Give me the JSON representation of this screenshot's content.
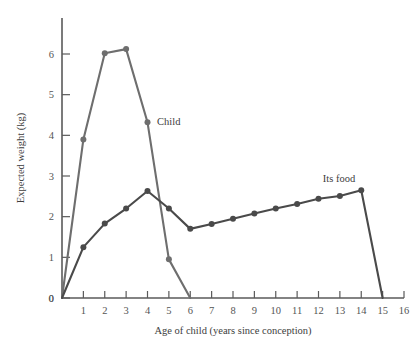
{
  "chart_data": {
    "type": "line",
    "title": "",
    "xlabel": "Age of child (years since conception)",
    "ylabel": "Expected weight (kg)",
    "xlim": [
      0,
      16
    ],
    "ylim": [
      0,
      6.6
    ],
    "xticks": [
      0,
      1,
      2,
      3,
      4,
      5,
      6,
      7,
      8,
      9,
      10,
      11,
      12,
      13,
      14,
      15,
      16
    ],
    "xtick_labels": [
      "0",
      "1",
      "2",
      "3",
      "4",
      "5",
      "6",
      "7",
      "8",
      "9",
      "10",
      "11",
      "12",
      "13",
      "14",
      "15",
      "16"
    ],
    "yticks": [
      0,
      1,
      2,
      3,
      4,
      5,
      6
    ],
    "ytick_labels": [
      "0",
      "1",
      "2",
      "3",
      "4",
      "5",
      "6"
    ],
    "grid": false,
    "legend": "inline-annotations",
    "series": [
      {
        "name": "Child",
        "color": "#6e6e6e",
        "annotation": "Child",
        "annotation_x": 4.45,
        "annotation_y": 4.35,
        "x": [
          0,
          1,
          2,
          3,
          4,
          5,
          6
        ],
        "values": [
          0,
          3.9,
          6.02,
          6.12,
          4.32,
          0.95,
          0
        ]
      },
      {
        "name": "Its food",
        "color": "#4a4a4a",
        "annotation": "Its food",
        "annotation_x": 12.2,
        "annotation_y": 2.95,
        "x": [
          0,
          1,
          2,
          3,
          4,
          5,
          6,
          7,
          8,
          9,
          10,
          11,
          12,
          13,
          14,
          15
        ],
        "values": [
          0,
          1.25,
          1.83,
          2.2,
          2.63,
          2.2,
          1.7,
          1.82,
          1.95,
          2.08,
          2.2,
          2.31,
          2.44,
          2.51,
          2.65,
          0
        ]
      }
    ]
  },
  "axis": {
    "x_title": "Age of child (years since conception)",
    "y_title": "Expected weight (kg)"
  }
}
